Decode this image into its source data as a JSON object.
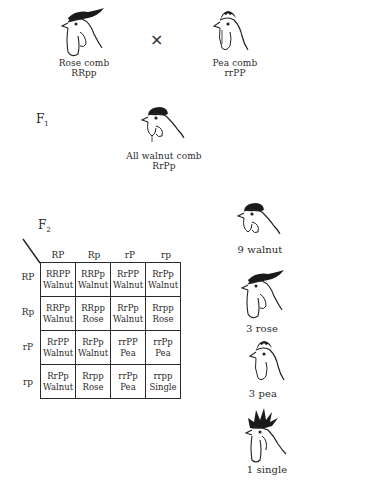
{
  "parents": {
    "left": {
      "name": "Rose comb",
      "genotype": "RRpp",
      "icon": "rose-comb-rooster-icon"
    },
    "cross_symbol": "×",
    "right": {
      "name": "Pea comb",
      "genotype": "rrPP",
      "icon": "pea-comb-rooster-icon"
    }
  },
  "f1": {
    "label": "F",
    "sub": "1",
    "name": "All walnut comb",
    "genotype": "RrPp",
    "icon": "walnut-comb-rooster-icon"
  },
  "f2": {
    "label": "F",
    "sub": "2",
    "column_headers": [
      "RP",
      "Rp",
      "rP",
      "rp"
    ],
    "row_headers": [
      "RP",
      "Rp",
      "rP",
      "rp"
    ],
    "cells": [
      [
        {
          "g": "RRPP",
          "p": "Walnut"
        },
        {
          "g": "RRPp",
          "p": "Walnut"
        },
        {
          "g": "RrPP",
          "p": "Walnut"
        },
        {
          "g": "RrPp",
          "p": "Walnut"
        }
      ],
      [
        {
          "g": "RRPp",
          "p": "Walnut"
        },
        {
          "g": "RRpp",
          "p": "Rose"
        },
        {
          "g": "RrPp",
          "p": "Walnut"
        },
        {
          "g": "Rrpp",
          "p": "Rose"
        }
      ],
      [
        {
          "g": "RrPP",
          "p": "Walnut"
        },
        {
          "g": "RrPp",
          "p": "Walnut"
        },
        {
          "g": "rrPP",
          "p": "Pea"
        },
        {
          "g": "rrPp",
          "p": "Pea"
        }
      ],
      [
        {
          "g": "RrPp",
          "p": "Walnut"
        },
        {
          "g": "Rrpp",
          "p": "Rose"
        },
        {
          "g": "rrPp",
          "p": "Pea"
        },
        {
          "g": "rrpp",
          "p": "Single"
        }
      ]
    ]
  },
  "ratios": [
    {
      "label": "9 walnut",
      "icon": "walnut-comb-rooster-icon"
    },
    {
      "label": "3 rose",
      "icon": "rose-comb-rooster-icon"
    },
    {
      "label": "3 pea",
      "icon": "pea-comb-rooster-icon"
    },
    {
      "label": "1 single",
      "icon": "single-comb-rooster-icon"
    }
  ]
}
